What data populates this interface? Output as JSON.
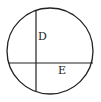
{
  "diagram": {
    "type": "circle-with-chords",
    "circle": {
      "cx": 50,
      "cy": 51,
      "r": 43
    },
    "lines": [
      {
        "id": "vertical-chord",
        "x1": 36,
        "y1": 10,
        "x2": 36,
        "y2": 92
      },
      {
        "id": "horizontal-chord",
        "x1": 8,
        "y1": 63,
        "x2": 93,
        "y2": 63
      }
    ],
    "labels": [
      {
        "text": "D",
        "x": 38,
        "y": 40
      },
      {
        "text": "E",
        "x": 58,
        "y": 74
      }
    ],
    "stroke_color": "#222222"
  }
}
